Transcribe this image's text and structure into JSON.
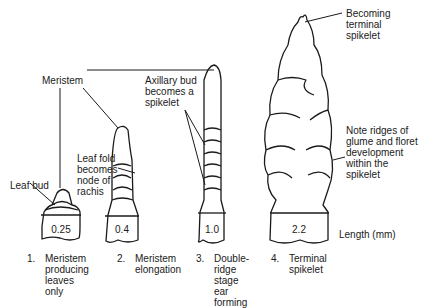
{
  "labels": {
    "meristem": "Meristem",
    "axillary_bud": "Axillary bud\nbecomes a\nspikelet",
    "becoming_terminal": "Becoming\nterminal\nspikelet",
    "leaf_bud": "Leaf bud",
    "leaf_fold": "Leaf fold\nbecomes\nnode of\nrachis",
    "note_ridges": "Note ridges of\nglume and floret\ndevelopment\nwithin the\nspikelet",
    "length_unit": "Length (mm)"
  },
  "stages": [
    {
      "number": "1.",
      "name": "Meristem\nproducing\nleaves only",
      "length": "0.25"
    },
    {
      "number": "2.",
      "name": "Meristem\nelongation",
      "length": "0.4"
    },
    {
      "number": "3.",
      "name": "Double-\nridge stage\near forming",
      "length": "1.0"
    },
    {
      "number": "4.",
      "name": "Terminal\nspikelet",
      "length": "2.2"
    }
  ]
}
